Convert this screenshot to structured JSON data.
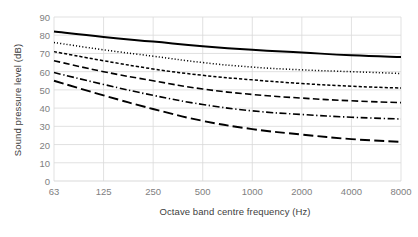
{
  "chart_data": {
    "type": "line",
    "title": "",
    "xlabel": "Octave band centre frequency (Hz)",
    "ylabel": "Sound pressure level (dB)",
    "categories": [
      "63",
      "125",
      "250",
      "500",
      "1000",
      "2000",
      "4000",
      "8000"
    ],
    "x_tick_labels": [
      "63",
      "125",
      "250",
      "500",
      "1000",
      "2000",
      "4000",
      "8000"
    ],
    "y_tick_labels": [
      "0",
      "10",
      "20",
      "30",
      "40",
      "50",
      "60",
      "70",
      "80",
      "90"
    ],
    "y_ticks": [
      0,
      10,
      20,
      30,
      40,
      50,
      60,
      70,
      80,
      90
    ],
    "ylim": [
      0,
      90
    ],
    "grid": true,
    "grid_color": "#d9d9d9",
    "legend": "none",
    "legend_position": "none",
    "line_color": "#000000",
    "series": [
      {
        "name": "curve-1",
        "style": "solid",
        "values": [
          82,
          79,
          76.5,
          74,
          72,
          70.5,
          69,
          68
        ]
      },
      {
        "name": "curve-2",
        "style": "dotted",
        "values": [
          76,
          72,
          68.5,
          65,
          62.5,
          61,
          60,
          59
        ]
      },
      {
        "name": "curve-3",
        "style": "short-dash",
        "values": [
          71,
          66,
          61.5,
          58,
          55.5,
          53.5,
          52,
          51
        ]
      },
      {
        "name": "curve-4",
        "style": "dashed",
        "values": [
          66,
          60,
          55,
          50.5,
          47.5,
          45.5,
          44,
          43
        ]
      },
      {
        "name": "curve-5",
        "style": "dash-dot",
        "values": [
          59.5,
          53,
          47,
          42,
          38.5,
          36.5,
          35,
          34
        ]
      },
      {
        "name": "curve-6",
        "style": "long-dash",
        "values": [
          55,
          47,
          39.5,
          33,
          28.5,
          25.5,
          23,
          21.5
        ]
      }
    ]
  }
}
